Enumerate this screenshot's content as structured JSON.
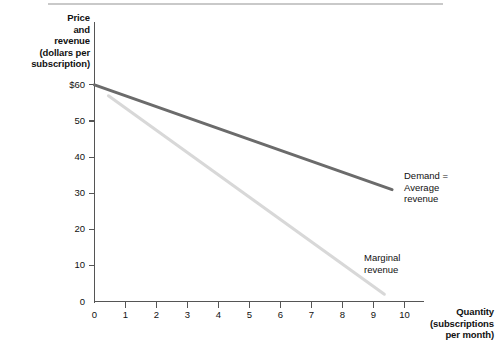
{
  "chart_data": {
    "type": "line",
    "title": "",
    "subtitle": "",
    "ylabel_lines": [
      "Price",
      "and",
      "revenue",
      "(dollars per",
      "subscription)"
    ],
    "xlabel_lines": [
      "Quantity",
      "(subscriptions",
      "per month)"
    ],
    "xlabel": "Quantity (subscriptions per month)",
    "ylabel": "Price and revenue (dollars per subscription)",
    "grid": false,
    "legend_position": "inline-annotation",
    "xlim": [
      0,
      10.6
    ],
    "ylim": [
      0,
      62
    ],
    "xticks": [
      0,
      1,
      2,
      3,
      4,
      5,
      6,
      7,
      8,
      9,
      10
    ],
    "xtick_labels": [
      "0",
      "1",
      "2",
      "3",
      "4",
      "5",
      "6",
      "7",
      "8",
      "9",
      "10"
    ],
    "yticks": [
      0,
      10,
      20,
      30,
      40,
      50,
      60
    ],
    "ytick_labels": [
      "0",
      "10",
      "20",
      "30",
      "40",
      "50",
      "$60"
    ],
    "series": [
      {
        "name": "Demand = Average revenue",
        "label_lines": [
          "Demand =",
          "Average",
          "revenue"
        ],
        "color": "#6b6b6b",
        "width": 3.0,
        "x": [
          0,
          9.6
        ],
        "values": [
          60,
          31
        ]
      },
      {
        "name": "Marginal revenue",
        "label_lines": [
          "Marginal",
          "revenue"
        ],
        "color": "#d8d8d8",
        "width": 3.0,
        "x": [
          0.45,
          9.35
        ],
        "values": [
          57,
          2
        ]
      }
    ]
  },
  "figure": {
    "top_rule_color": "#c9c9c9",
    "axis_color": "#555555",
    "background": "#ffffff"
  }
}
